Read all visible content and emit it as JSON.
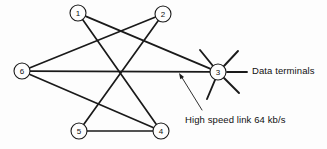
{
  "figure": {
    "background_color": "#fdfdfd",
    "line_color": "#1a1a1a",
    "width": 327,
    "height": 149
  },
  "nodes": [
    {
      "id": "1",
      "label": "1",
      "x": 78,
      "y": 13,
      "radius": 8
    },
    {
      "id": "2",
      "label": "2",
      "x": 163,
      "y": 14,
      "radius": 8
    },
    {
      "id": "3",
      "label": "3",
      "x": 218,
      "y": 72,
      "radius": 8
    },
    {
      "id": "4",
      "label": "4",
      "x": 161,
      "y": 131,
      "radius": 8
    },
    {
      "id": "5",
      "label": "5",
      "x": 79,
      "y": 131,
      "radius": 8
    },
    {
      "id": "6",
      "label": "6",
      "x": 22,
      "y": 71,
      "radius": 8
    }
  ],
  "links": [
    {
      "from": "1",
      "to": "3",
      "name": "link-1-3"
    },
    {
      "from": "1",
      "to": "4",
      "name": "link-1-4"
    },
    {
      "from": "2",
      "to": "6",
      "name": "link-2-6"
    },
    {
      "from": "2",
      "to": "5",
      "name": "link-2-5"
    },
    {
      "from": "6",
      "to": "3",
      "name": "link-6-3"
    },
    {
      "from": "6",
      "to": "4",
      "name": "link-6-4"
    },
    {
      "from": "5",
      "to": "4",
      "name": "link-5-4"
    }
  ],
  "terminal_spokes": [
    {
      "name": "terminal-spoke-upper-left",
      "x1": 213,
      "y1": 66,
      "x2": 200,
      "y2": 50
    },
    {
      "name": "terminal-spoke-upper-right",
      "x1": 224,
      "y1": 66,
      "x2": 238,
      "y2": 51
    },
    {
      "name": "terminal-spoke-right",
      "x1": 227,
      "y1": 72,
      "x2": 247,
      "y2": 72
    },
    {
      "name": "terminal-spoke-lower-right",
      "x1": 224,
      "y1": 78,
      "x2": 239,
      "y2": 93
    },
    {
      "name": "terminal-spoke-lower-left",
      "x1": 215,
      "y1": 80,
      "x2": 207,
      "y2": 99
    }
  ],
  "annotations": {
    "data_terminals": {
      "label": "Data terminals",
      "x": 252,
      "y": 65
    },
    "high_speed_link": {
      "label": "High speed link 64 kb/s",
      "x": 185,
      "y": 114,
      "leader": {
        "x1": 202,
        "y1": 110,
        "x2": 181,
        "y2": 76
      },
      "arrow_tip": {
        "x": 179,
        "y": 73
      }
    }
  }
}
